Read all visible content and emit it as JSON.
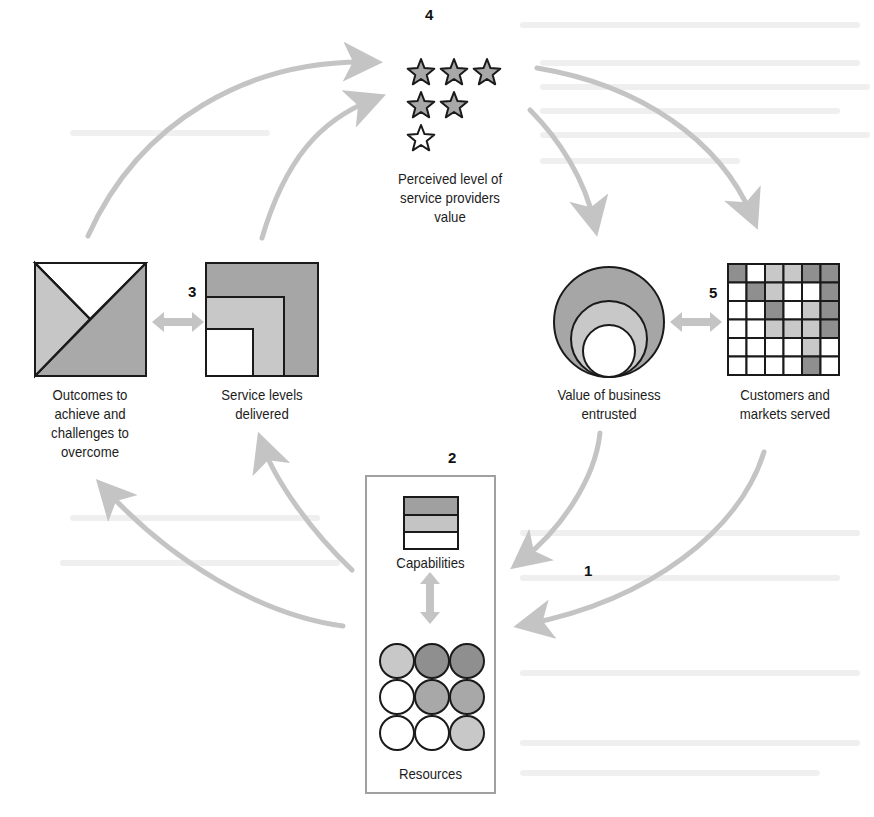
{
  "diagram": {
    "numbers": {
      "n1": "1",
      "n2": "2",
      "n3": "3",
      "n4": "4",
      "n5": "5"
    },
    "nodes": {
      "perceived_value": {
        "label_line1": "Perceived level of",
        "label_line2": "service providers",
        "label_line3": "value",
        "icon": "star-rating-icon",
        "stars_filled": 5,
        "stars_empty": 1
      },
      "outcomes": {
        "label_line1": "Outcomes to",
        "label_line2": "achieve and",
        "label_line3": "challenges to",
        "label_line4": "overcome",
        "icon": "split-square-icon"
      },
      "service_levels": {
        "label_line1": "Service levels",
        "label_line2": "delivered",
        "icon": "nested-squares-icon"
      },
      "business_value": {
        "label_line1": "Value of business",
        "label_line2": "entrusted",
        "icon": "nested-circles-icon"
      },
      "customers": {
        "label_line1": "Customers and",
        "label_line2": "markets served",
        "icon": "grid-matrix-icon",
        "grid": [
          [
            "D",
            "W",
            "L",
            "L",
            "D",
            "D"
          ],
          [
            "W",
            "D",
            "L",
            "W",
            "W",
            "D"
          ],
          [
            "W",
            "W",
            "D",
            "W",
            "L",
            "D"
          ],
          [
            "W",
            "W",
            "L",
            "L",
            "L",
            "D"
          ],
          [
            "W",
            "W",
            "W",
            "W",
            "L",
            "W"
          ],
          [
            "W",
            "W",
            "W",
            "W",
            "D",
            "W"
          ]
        ]
      },
      "capabilities": {
        "label": "Capabilities",
        "icon": "stacked-layers-icon"
      },
      "resources": {
        "label": "Resources",
        "icon": "circle-grid-icon",
        "circles": [
          [
            "L",
            "D",
            "D"
          ],
          [
            "W",
            "M",
            "M"
          ],
          [
            "W",
            "W",
            "L"
          ]
        ]
      }
    },
    "colors": {
      "dark": "#8f8f8f",
      "medium": "#a8a8a8",
      "light": "#c8c8c8",
      "white": "#ffffff",
      "arrow": "#c4c4c4",
      "stroke": "#1a1a1a",
      "box": "#a0a0a0"
    }
  }
}
